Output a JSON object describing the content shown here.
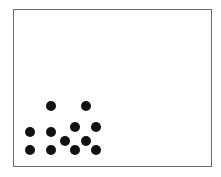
{
  "canvas": {
    "width": 221,
    "height": 177,
    "background": "#ffffff"
  },
  "frame": {
    "x": 13,
    "y": 9,
    "width": 199,
    "height": 158,
    "border_color": "#6b6b6b"
  },
  "dot_style": {
    "diameter": 10,
    "color": "#111111"
  },
  "dot_count": 12,
  "dots": [
    {
      "cx": 51,
      "cy": 106
    },
    {
      "cx": 86,
      "cy": 106
    },
    {
      "cx": 75,
      "cy": 127
    },
    {
      "cx": 96,
      "cy": 127
    },
    {
      "cx": 30,
      "cy": 132
    },
    {
      "cx": 51,
      "cy": 132
    },
    {
      "cx": 65,
      "cy": 141
    },
    {
      "cx": 86,
      "cy": 141
    },
    {
      "cx": 30,
      "cy": 150
    },
    {
      "cx": 51,
      "cy": 150
    },
    {
      "cx": 75,
      "cy": 150
    },
    {
      "cx": 96,
      "cy": 150
    }
  ]
}
